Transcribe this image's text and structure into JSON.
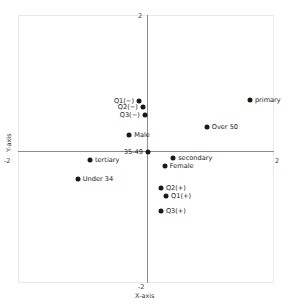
{
  "chart_data": {
    "type": "scatter",
    "title": "",
    "xlabel": "X-axis",
    "ylabel": "Y-axis",
    "xlim": [
      -2,
      2
    ],
    "ylim": [
      -2,
      2
    ],
    "xticks": [
      "-2",
      "2"
    ],
    "yticks": [
      "-2",
      "2"
    ],
    "grid": false,
    "legend": "none",
    "axis_lines_at_zero": true,
    "points": [
      {
        "label": "Q1(−)",
        "x": -0.14,
        "y": 0.79,
        "label_side": "left"
      },
      {
        "label": "Q2(−)",
        "x": -0.08,
        "y": 0.69,
        "label_side": "left"
      },
      {
        "label": "Q3(−)",
        "x": -0.05,
        "y": 0.57,
        "label_side": "left"
      },
      {
        "label": "Male",
        "x": -0.29,
        "y": 0.26,
        "label_side": "right"
      },
      {
        "label": "35-49",
        "x": 0.0,
        "y": 0.0,
        "label_side": "left"
      },
      {
        "label": "primary",
        "x": 1.58,
        "y": 0.81,
        "label_side": "right"
      },
      {
        "label": "Over 50",
        "x": 0.91,
        "y": 0.39,
        "label_side": "right"
      },
      {
        "label": "tertiary",
        "x": -0.9,
        "y": -0.12,
        "label_side": "right"
      },
      {
        "label": "Under 34",
        "x": -1.09,
        "y": -0.42,
        "label_side": "right"
      },
      {
        "label": "secondary",
        "x": 0.39,
        "y": -0.09,
        "label_side": "right"
      },
      {
        "label": "Female",
        "x": 0.26,
        "y": -0.22,
        "label_side": "right"
      },
      {
        "label": "Q2(+)",
        "x": 0.2,
        "y": -0.56,
        "label_side": "right"
      },
      {
        "label": "Q1(+)",
        "x": 0.28,
        "y": -0.68,
        "label_side": "right"
      },
      {
        "label": "Q3(+)",
        "x": 0.2,
        "y": -0.91,
        "label_side": "right"
      }
    ],
    "colors": {
      "marker": "#1a1a1a",
      "axis": "#8c8c8c",
      "frame": "#e9e9e9",
      "text": "#3a3a3a",
      "background": "#ffffff"
    }
  }
}
